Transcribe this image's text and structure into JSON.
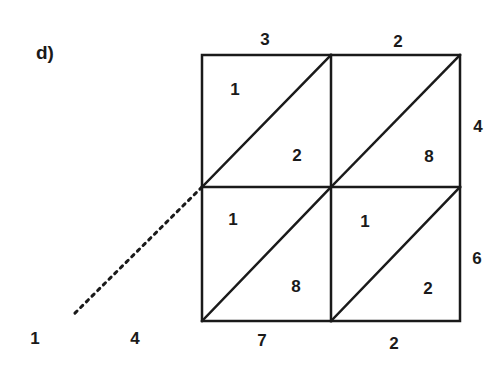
{
  "label": "d)",
  "multiplicand_digits": [
    "3",
    "2"
  ],
  "multiplier_digits": [
    "4",
    "6"
  ],
  "cells": [
    {
      "row": 0,
      "col": 0,
      "tens": "1",
      "ones": "2"
    },
    {
      "row": 0,
      "col": 1,
      "tens": "",
      "ones": "8"
    },
    {
      "row": 1,
      "col": 0,
      "tens": "1",
      "ones": "8"
    },
    {
      "row": 1,
      "col": 1,
      "tens": "1",
      "ones": "2"
    }
  ],
  "answer_digits": [
    "1",
    "4",
    "7",
    "2"
  ],
  "colors": {
    "line": "#1a1a1a",
    "background": "#ffffff"
  }
}
